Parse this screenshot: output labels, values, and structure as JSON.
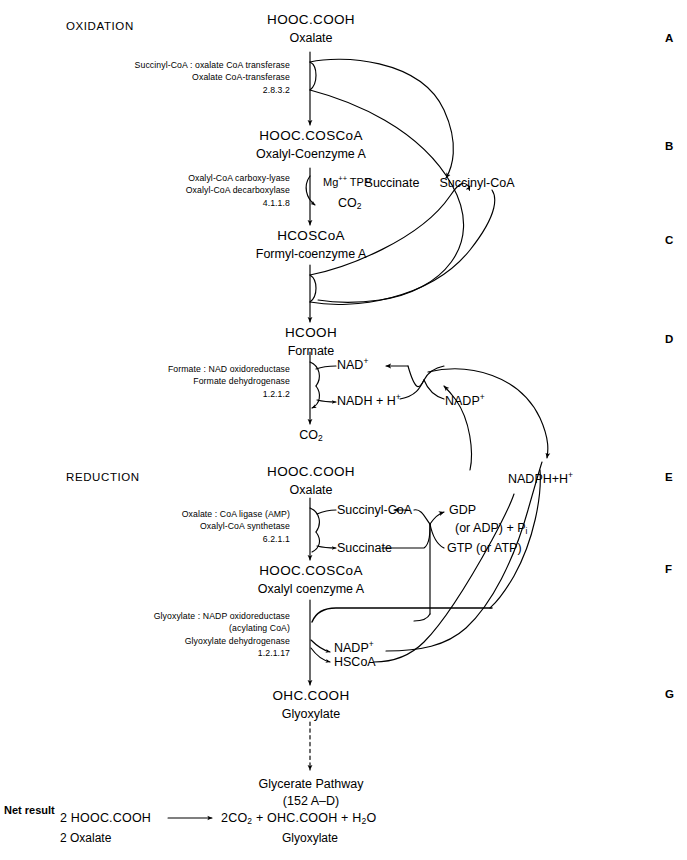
{
  "page": {
    "width": 687,
    "height": 860,
    "background": "#ffffff",
    "ink": "#000000"
  },
  "sections": {
    "oxidation_label": "OXIDATION",
    "reduction_label": "REDUCTION"
  },
  "margin_letters": [
    "A",
    "B",
    "C",
    "D",
    "E",
    "F",
    "G"
  ],
  "metabolites": {
    "oxalate_top": {
      "formula": "HOOC.COOH",
      "name": "Oxalate"
    },
    "oxalyl_coa_top": {
      "formula": "HOOC.COSCoA",
      "name": "Oxalyl-Coenzyme A"
    },
    "formyl_coa": {
      "formula": "HCOSCoA",
      "name": "Formyl-coenzyme A"
    },
    "formate": {
      "formula": "HCOOH",
      "name": "Formate"
    },
    "oxalate_bottom": {
      "formula": "HOOC.COOH",
      "name": "Oxalate"
    },
    "oxalyl_coa_bottom": {
      "formula": "HOOC.COSCoA",
      "name": "Oxalyl coenzyme A"
    },
    "glyoxylate": {
      "formula": "OHC.COOH",
      "name": "Glyoxylate"
    }
  },
  "enzymes": {
    "coa_transferase": {
      "line1": "Succinyl-CoA : oxalate CoA transferase",
      "line2": "Oxalate CoA-transferase",
      "ec": "2.8.3.2"
    },
    "carboxy_lyase": {
      "line1": "Oxalyl-CoA carboxy-lyase",
      "line2": "Oxalyl-CoA decarboxylase",
      "ec": "4.1.1.8"
    },
    "formate_dehydrogenase": {
      "line1": "Formate : NAD oxidoreductase",
      "line2": "Formate dehydrogenase",
      "ec": "1.2.1.2"
    },
    "coa_ligase": {
      "line1": "Oxalate : CoA ligase (AMP)",
      "line2": "Oxalyl-CoA synthetase",
      "ec": "6.2.1.1"
    },
    "glyoxylate_dehydrogenase": {
      "line1": "Glyoxylate : NADP oxidoreductase",
      "line2": "(acylating CoA)",
      "line3": "Glyoxylate dehydrogenase",
      "ec": "1.2.1.17"
    }
  },
  "cofactors": {
    "mg_tpp": "Mg",
    "mg_tpp_sup": "++",
    "mg_tpp_tail": " TPP",
    "co2_oxid": "CO",
    "co2_sub": "2",
    "succinate_top": "Succinate",
    "succinyl_coa_top": "Succinyl-CoA",
    "nad_plus": "NAD",
    "nad_plus_sup": "+",
    "nadh_h": "NADH + H",
    "nadh_h_sup": "+",
    "nadp_plus_upper": "NADP",
    "nadp_plus_upper_sup": "+",
    "co2_formate": "CO",
    "co2_formate_sub": "2",
    "nadph_h": "NADPH",
    "nadph_h_plus": "+H",
    "nadph_h_sup": "+",
    "succinyl_coa_lower": "Succinyl-CoA",
    "succinate_lower": "Succinate",
    "gdp": "GDP",
    "gdp_line2": "(or ADP) + P",
    "gdp_line2_sub": "i",
    "gtp": "GTP (or ATP)",
    "nadp_plus_lower": "NADP",
    "nadp_plus_lower_sup": "+",
    "hscoa": "HSCoA"
  },
  "downstream": {
    "title": "Glycerate Pathway",
    "reference": "(152 A–D)"
  },
  "net_result": {
    "label": "Net result",
    "left_formula": "2 HOOC.COOH",
    "left_name": "2 Oxalate",
    "arrow": "⟶",
    "right_a": "2CO",
    "right_a_sub": "2",
    "right_b": " + OHC.COOH + H",
    "right_b_sub": "2",
    "right_c": "O",
    "right_name": "Glyoxylate"
  }
}
